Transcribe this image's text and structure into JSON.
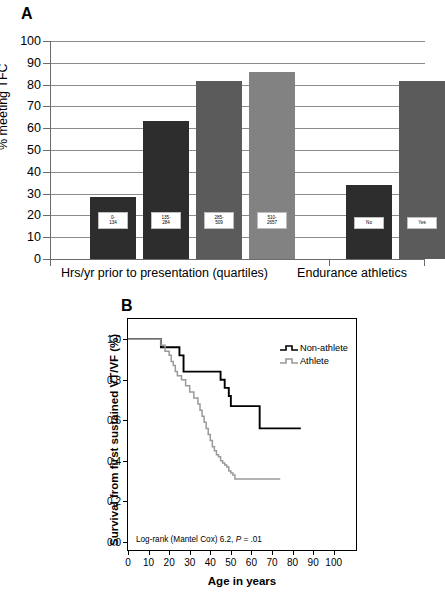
{
  "figure": {
    "panel_a_letter": "A",
    "panel_b_letter": "B"
  },
  "chart_data": [
    {
      "type": "bar",
      "panel": "A",
      "title": "",
      "xlabel": "",
      "ylabel": "% meeting TFC",
      "ylim": [
        0,
        100
      ],
      "ytick_labels": [
        "0",
        "10",
        "20",
        "30",
        "40",
        "50",
        "60",
        "70",
        "80",
        "90",
        "100"
      ],
      "ytick_values": [
        0,
        10,
        20,
        30,
        40,
        50,
        60,
        70,
        80,
        90,
        100
      ],
      "grid": true,
      "groups": [
        {
          "name": "Hrs/yr prior to presentation (quartiles)",
          "categories": [
            "0-134",
            "135-284",
            "285-509",
            "510-2657"
          ],
          "values": [
            28.5,
            63.5,
            81.5,
            86.0
          ],
          "colors": [
            "#2d2d2d",
            "#2d2d2d",
            "#5b5b5b",
            "#828282"
          ]
        },
        {
          "name": "Endurance athletics",
          "categories": [
            "No",
            "Yes"
          ],
          "values": [
            34.0,
            81.5
          ],
          "colors": [
            "#2d2d2d",
            "#5b5b5b"
          ]
        }
      ]
    },
    {
      "type": "line",
      "panel": "B",
      "title": "",
      "xlabel": "Age in years",
      "ylabel": "Survival from first sustained VT/VF (%)",
      "xlim": [
        0,
        105
      ],
      "ylim": [
        0.0,
        1.05
      ],
      "xtick_labels": [
        "0",
        "10",
        "20",
        "30",
        "40",
        "50",
        "60",
        "70",
        "80",
        "90",
        "100"
      ],
      "xtick_values": [
        0,
        10,
        20,
        30,
        40,
        50,
        60,
        70,
        80,
        90,
        100
      ],
      "ytick_labels": [
        "0.0",
        "0.2",
        "0.4",
        "0.6",
        "0.8",
        "1.0"
      ],
      "ytick_values": [
        0.0,
        0.2,
        0.4,
        0.6,
        0.8,
        1.0
      ],
      "grid": false,
      "legend_position": "top-right",
      "annotation": "Log-rank (Mantel Cox) 6.2, P = .01",
      "annotation_prefix": "Log-rank (Mantel Cox) 6.2, ",
      "annotation_italic": "P",
      "annotation_suffix": " = .01",
      "series": [
        {
          "name": "Non-athlete",
          "color": "#000000",
          "x": [
            0,
            15,
            16,
            24,
            25,
            26,
            27,
            28,
            44,
            45,
            46,
            47,
            48,
            49,
            50,
            63,
            64,
            65,
            84
          ],
          "y": [
            1.0,
            1.0,
            0.96,
            0.96,
            0.92,
            0.92,
            0.84,
            0.84,
            0.84,
            0.8,
            0.8,
            0.76,
            0.76,
            0.72,
            0.67,
            0.67,
            0.56,
            0.56,
            0.56
          ]
        },
        {
          "name": "Athlete",
          "color": "#9a9a9a",
          "x": [
            0,
            15,
            16,
            18,
            20,
            21,
            22,
            23,
            24,
            26,
            28,
            30,
            32,
            34,
            35,
            36,
            37,
            38,
            39,
            40,
            41,
            42,
            43,
            44,
            45,
            46,
            47,
            48,
            49,
            50,
            51,
            52,
            74
          ],
          "y": [
            1.0,
            1.0,
            0.97,
            0.94,
            0.92,
            0.89,
            0.87,
            0.84,
            0.82,
            0.8,
            0.77,
            0.74,
            0.71,
            0.68,
            0.65,
            0.62,
            0.59,
            0.56,
            0.53,
            0.5,
            0.47,
            0.45,
            0.43,
            0.42,
            0.4,
            0.39,
            0.38,
            0.37,
            0.35,
            0.34,
            0.33,
            0.31,
            0.31
          ]
        }
      ]
    }
  ]
}
